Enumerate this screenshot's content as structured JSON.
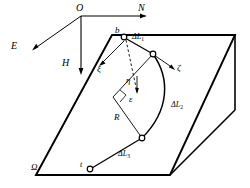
{
  "figure": {
    "type": "technical-line-diagram",
    "background_color": "#ffffff",
    "line_color": "#000000"
  },
  "axes": {
    "origin_label": "O",
    "north_label": "N",
    "east_label": "E",
    "depth_label": "H"
  },
  "points": {
    "top_station": "b",
    "bottom_station": "t"
  },
  "angles": {
    "xi": "ξ",
    "zeta": "ζ",
    "eta": "η",
    "epsilon": "ε",
    "omega": "Ω"
  },
  "segments": {
    "radius": "R",
    "delta_l1_text": "ΔL",
    "delta_l1_sub": "1",
    "delta_l2_text": "ΔL",
    "delta_l2_sub": "2",
    "delta_l3_text": "ΔL",
    "delta_l3_sub": "3"
  }
}
